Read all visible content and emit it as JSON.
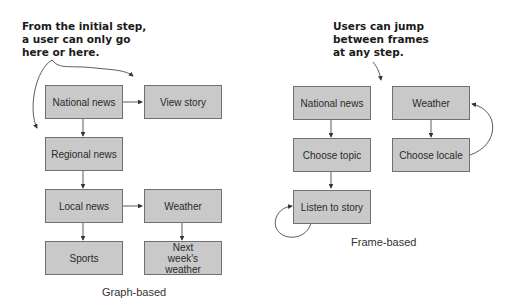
{
  "graph_based": {
    "annotation": [
      "From the initial step,",
      "a user can only go",
      "here or here."
    ],
    "caption": "Graph-based",
    "nodes": [
      {
        "id": "national_news",
        "label": "National news"
      },
      {
        "id": "view_story",
        "label": "View story"
      },
      {
        "id": "regional_news",
        "label": "Regional news"
      },
      {
        "id": "local_news",
        "label": "Local news"
      },
      {
        "id": "weather",
        "label": "Weather"
      },
      {
        "id": "sports",
        "label": "Sports"
      },
      {
        "id": "next_weeks_weather",
        "label": "Next week's weather"
      }
    ],
    "edges": [
      [
        "national_news",
        "view_story"
      ],
      [
        "national_news",
        "regional_news"
      ],
      [
        "regional_news",
        "local_news"
      ],
      [
        "local_news",
        "weather"
      ],
      [
        "local_news",
        "sports"
      ],
      [
        "weather",
        "next_weeks_weather"
      ]
    ]
  },
  "frame_based": {
    "annotation": [
      "Users can jump",
      "between frames",
      "at any step."
    ],
    "caption": "Frame-based",
    "nodes": [
      {
        "id": "national_news",
        "label": "National news"
      },
      {
        "id": "weather",
        "label": "Weather"
      },
      {
        "id": "choose_topic",
        "label": "Choose topic"
      },
      {
        "id": "choose_locale",
        "label": "Choose locale"
      },
      {
        "id": "listen_to_story",
        "label": "Listen to story"
      }
    ],
    "edges": [
      [
        "national_news",
        "choose_topic"
      ],
      [
        "choose_topic",
        "listen_to_story"
      ],
      [
        "listen_to_story",
        "listen_to_story"
      ],
      [
        "weather",
        "choose_locale"
      ],
      [
        "choose_locale",
        "weather"
      ]
    ]
  },
  "colors": {
    "box_fill": "#c9c9c9",
    "box_border": "#707070",
    "arrow": "#333333"
  }
}
